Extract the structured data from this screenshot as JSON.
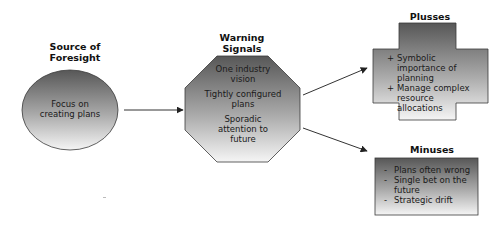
{
  "source": {
    "title": "Source of Foresight",
    "title_lines": [
      "Source of",
      "Foresight"
    ],
    "shape": "ellipse",
    "body_lines": [
      "Focus on",
      "creating plans"
    ]
  },
  "warning": {
    "title_lines": [
      "Warning",
      "Signals"
    ],
    "shape": "octagon",
    "items": [
      {
        "lines": [
          "One industry",
          "vision"
        ]
      },
      {
        "lines": [
          "Tightly configured",
          "plans"
        ]
      },
      {
        "lines": [
          "Sporadic",
          "attention to",
          "future"
        ]
      }
    ]
  },
  "plusses": {
    "title": "Plusses",
    "shape": "cross",
    "bullet": "+",
    "items": [
      {
        "lines": [
          "Symbolic",
          "importance of",
          "planning"
        ]
      },
      {
        "lines": [
          "Manage complex",
          "resource",
          "allocations"
        ]
      }
    ]
  },
  "minuses": {
    "title": "Minuses",
    "shape": "rectangle",
    "bullet": "-",
    "items": [
      {
        "lines": [
          "Plans often wrong"
        ]
      },
      {
        "lines": [
          "Single bet on the",
          "future"
        ]
      },
      {
        "lines": [
          "Strategic drift"
        ]
      }
    ]
  },
  "colors": {
    "gradient_dark": "#5a5a5a",
    "gradient_light": "#f4f4f4",
    "outline": "#3a3a3a",
    "arrow": "#333333"
  }
}
